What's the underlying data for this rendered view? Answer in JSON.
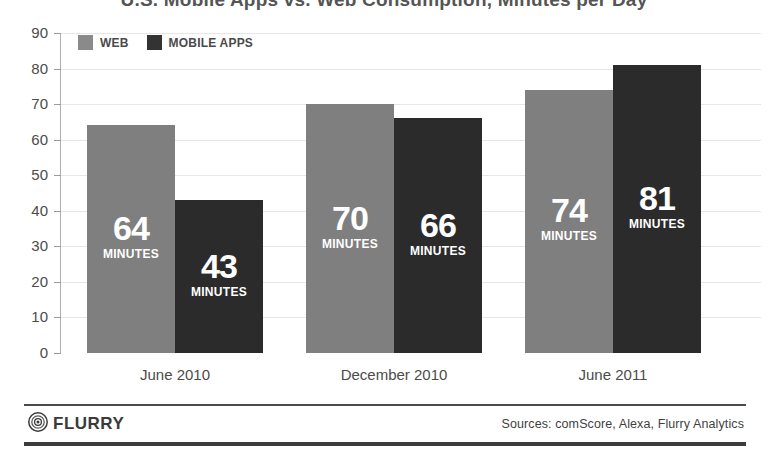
{
  "chart_data": {
    "type": "bar",
    "title": "U.S. Mobile Apps vs. Web Consumption, Minutes per Day",
    "xlabel": "",
    "ylabel": "",
    "ylim": [
      0,
      90
    ],
    "ytick_step": 10,
    "yticks": [
      "90",
      "80",
      "70",
      "60",
      "50",
      "40",
      "30",
      "20",
      "10",
      "0"
    ],
    "grid": true,
    "legend_position": "top-left",
    "categories": [
      "June 2010",
      "December 2010",
      "June 2011"
    ],
    "series": [
      {
        "name": "WEB",
        "color": "#7f7f7f",
        "values": [
          64,
          70,
          74
        ]
      },
      {
        "name": "MOBILE APPS",
        "color": "#2b2b2b",
        "values": [
          43,
          66,
          81
        ]
      }
    ],
    "value_unit_label": "MINUTES",
    "annotations": [
      {
        "category": "June 2010",
        "series": "WEB",
        "text": "64 MINUTES"
      },
      {
        "category": "June 2010",
        "series": "MOBILE APPS",
        "text": "43 MINUTES"
      },
      {
        "category": "December 2010",
        "series": "WEB",
        "text": "70 MINUTES"
      },
      {
        "category": "December 2010",
        "series": "MOBILE APPS",
        "text": "66 MINUTES"
      },
      {
        "category": "June 2011",
        "series": "WEB",
        "text": "74 MINUTES"
      },
      {
        "category": "June 2011",
        "series": "MOBILE APPS",
        "text": "81 MINUTES"
      }
    ]
  },
  "legend": {
    "items": [
      {
        "label": "WEB",
        "color": "#8a8a8a"
      },
      {
        "label": "MOBILE APPS",
        "color": "#333333"
      }
    ]
  },
  "footer": {
    "brand": "FLURRY",
    "logo_icon": "flurry-target-icon",
    "sources": "Sources: comScore, Alexa, Flurry Analytics"
  }
}
